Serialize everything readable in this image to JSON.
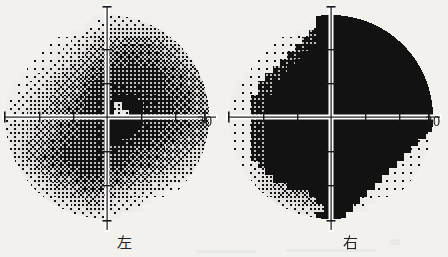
{
  "figure": {
    "type": "visual-field-grayscale-chart-pair",
    "background_color": "#f2f1ee",
    "ink_color": "#141414"
  },
  "plots": [
    {
      "id": "left-eye",
      "eye_label": "左",
      "eye_label_meaning": "left",
      "axis_degree_label": "30",
      "axis": {
        "horizontal_ticks": [
          -20,
          -10,
          10,
          20
        ],
        "vertical_ticks": [
          -20,
          -10,
          10,
          20
        ],
        "axis_line_color": "#ffffff",
        "tick_color": "#1a1a1a",
        "range_degrees": 30
      },
      "grid_size": 28,
      "description": "Dense loss temporally (left side of plot) with mottled mid-gray superior field; relatively preserved nasally (right side).",
      "field": [
        "000000000000112222222221000000",
        "000000000001123333333332100000",
        "000000000112344444444433210000",
        "000000011223455566665544321000",
        "000000112234556677776655432100",
        "000001122345567888877665443210",
        "000011223455678889888766544321",
        "000112234556789999999877655432",
        "001122345567899999999987765543",
        "011223455678999aa9a999877665443",
        "011233455678999aaaa9998877665544",
        "112334556789aaabbbaaa9988766554",
        "122344567789aab3bbbaa99887665544",
        "123445567899aab22bbaa998877665544",
        "223445677899aabbbbbaa9988776655",
        "233455677899aabbbbaa99887766554",
        "233455678899aabbbaa998877665543",
        "234556778999aabbaa9988776655432",
        "234556789999aaaa99887766554432",
        "234567789999aa9998877665544321",
        "223456778999999988776655443210",
        "122345677899998877665544332100",
        "112234566788887766554433210000",
        "011223455677776655443321000000",
        "001122344566655443322100000000",
        "000112233445544332210000000000",
        "000011122334433221100000000000",
        "000000111222221100000000000000"
      ]
    },
    {
      "id": "right-eye",
      "eye_label": "右",
      "eye_label_meaning": "right",
      "axis_degree_label": "30",
      "axis": {
        "horizontal_ticks": [
          -20,
          -10,
          10,
          20
        ],
        "vertical_ticks": [
          -20,
          -10,
          10,
          20
        ],
        "axis_line_color": "#ffffff",
        "tick_color": "#1a1a1a",
        "range_degrees": 30
      },
      "grid_size": 28,
      "description": "Complete dense defect across the entire right half of the field (homonymous hemianopia respecting the vertical midline); left half near normal with mild inferior depression.",
      "field": [
        "000000000000bbbbbbbbbbbb000000",
        "000000000001bbbbbbbbbbbbb00000",
        "00000000011abbbbbbbbbbbbbb0000",
        "0000000111aabbbbbbbbbbbbbbb000",
        "000000111aabbbbbbbbbbbbbbbb100",
        "00000111aabbbbbbbbbbbbbbbbbb10",
        "0000111aabbbbbbbbbbbbbbbbbbb11",
        "000111aabbbbbbbbbbbbbbbbbbbb11",
        "00111aabbbbbbbbbbbbbbbbbbbbb11",
        "0111aabbbbbbbbbbbbbbbbbbbbbb111",
        "0111aabbbbbbbbbbbbbbbbbbbbbb111",
        "111aabbbbbbbbbbbbbbbbbbbbbbb11",
        "111aabbbbbbbbbbbbbbbbbbbbbbb111",
        "111aabbbbbbbbbbbbbbbbbbbbbbb1111",
        "111aabbbbbbbbbbbbbbbbbbbbbbb11",
        "111aabbbbbbbbbbbbbbbbbbbbbbb11",
        "111aabbbbbbbbbbbbbbbbbbbbbb111",
        "111aabbbbbbbbbbbbbbbbbbbbb1111",
        "111aabbbbbbbbbbbbbbbbbbbb11111",
        "111aabbbbbbbbbbbbbbbbbbb111111",
        "1112abbbbbbbbbbbbbbbbbb1111110",
        "11123bbbbbbbbbbbbbbbbb11111100",
        "111234bbbbbbbbbbbbbbb1111100000",
        "01123455bbbbbbbbbbbb111100000",
        "00112345566bbbbbbbb1110000000",
        "000112334455bbbbbb11000000000",
        "0000111223344bbbb110000000000",
        "000000111222bbbb0000000000000"
      ]
    }
  ],
  "legend_levels": {
    "0": "off-field / outside test area",
    "1": "normal sensitivity (lightest)",
    "b": "dense absolute defect (black)"
  }
}
